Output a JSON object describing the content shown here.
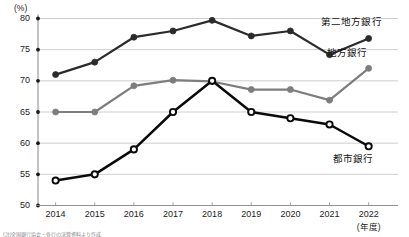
{
  "chart_data": {
    "type": "line",
    "title": "",
    "subtitle": "",
    "xlabel": "(年度)",
    "ylabel": "(%)",
    "yunit": "(%)",
    "x": [
      2014,
      2015,
      2016,
      2017,
      2018,
      2019,
      2020,
      2021,
      2022
    ],
    "categories": [
      "2014",
      "2015",
      "2016",
      "2017",
      "2018",
      "2019",
      "2020",
      "2021",
      "2022"
    ],
    "xlim": [
      2013.55,
      2022.75
    ],
    "ylim": [
      50,
      80
    ],
    "yticks": [
      50,
      55,
      60,
      65,
      70,
      75,
      80
    ],
    "ytick_labels": [
      "50",
      "55",
      "60",
      "65",
      "70",
      "75",
      "80"
    ],
    "grid": true,
    "grid_axis": "y",
    "legend": "inline-right",
    "series": [
      {
        "name": "第二地方銀行",
        "color": "#2b2b2b",
        "marker": "filled-circle",
        "values": [
          71.0,
          73.0,
          77.0,
          78.0,
          79.7,
          77.2,
          78.0,
          74.2,
          76.8
        ]
      },
      {
        "name": "地方銀行",
        "color": "#7d7d7d",
        "marker": "filled-circle",
        "values": [
          65.0,
          65.0,
          69.2,
          70.1,
          69.9,
          68.6,
          68.6,
          66.9,
          72.0
        ]
      },
      {
        "name": "都市銀行",
        "color": "#0a0a0a",
        "marker": "hollow-circle",
        "values": [
          54.0,
          55.0,
          59.0,
          65.0,
          70.0,
          65.0,
          64.0,
          63.0,
          59.5
        ]
      }
    ],
    "annotations": [
      {
        "text": "第二地方銀行",
        "series": "第二地方銀行"
      },
      {
        "text": "地方銀行",
        "series": "地方銀行"
      },
      {
        "text": "都市銀行",
        "series": "都市銀行"
      }
    ],
    "source_note": "(注)全国銀行協会・各行の決算資料より作成"
  }
}
